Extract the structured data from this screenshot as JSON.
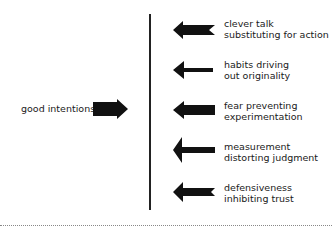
{
  "diagram": {
    "source_label": "good intentions",
    "forces": [
      {
        "line1": "clever talk",
        "line2": "substituting for action"
      },
      {
        "line1": "habits driving",
        "line2": "out originality"
      },
      {
        "line1": "fear preventing",
        "line2": "experimentation"
      },
      {
        "line1": "measurement",
        "line2": "distorting judgment"
      },
      {
        "line1": "defensiveness",
        "line2": "inhibiting trust"
      }
    ],
    "colors": {
      "arrow": "#111111",
      "line": "#222222",
      "text": "#1a1a1a"
    }
  }
}
